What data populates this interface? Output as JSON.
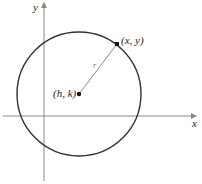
{
  "diagram": {
    "axes": {
      "x_label": "x",
      "y_label": "y",
      "axis_color": "#888888"
    },
    "circle": {
      "stroke_color": "#333333"
    },
    "points": {
      "center_label": "(h, k)",
      "point_label": "(x, y)"
    },
    "radius": {
      "label": "r",
      "line_color": "#888888"
    }
  }
}
